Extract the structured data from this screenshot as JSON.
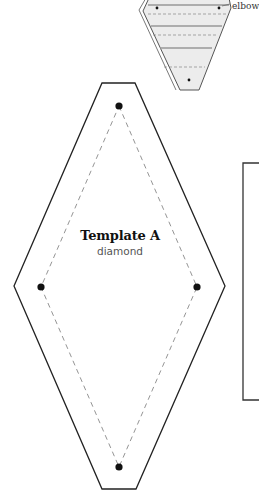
{
  "template": {
    "title": "Template A",
    "subtitle": "diamond"
  },
  "top_piece": {
    "label": "elbow"
  },
  "colors": {
    "outline": "#222222",
    "dashed": "#888888",
    "piece_fill": "#ececec",
    "dot": "#111111"
  }
}
